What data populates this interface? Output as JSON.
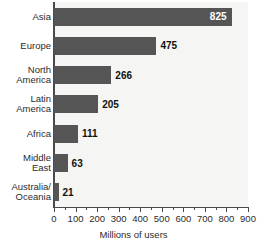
{
  "chart_data": {
    "type": "bar",
    "orientation": "horizontal",
    "title": "",
    "xlabel": "Millions of users",
    "ylabel": "",
    "categories": [
      "Asia",
      "Europe",
      "North America",
      "Latin America",
      "Africa",
      "Middle East",
      "Australia/ Oceania"
    ],
    "category_lines": [
      [
        "Asia"
      ],
      [
        "Europe"
      ],
      [
        "North",
        "America"
      ],
      [
        "Latin",
        "America"
      ],
      [
        "Africa"
      ],
      [
        "Middle",
        "East"
      ],
      [
        "Australia/",
        "Oceania"
      ]
    ],
    "values": [
      825,
      475,
      266,
      205,
      111,
      63,
      21
    ],
    "value_labels": [
      "825",
      "475",
      "266",
      "205",
      "111",
      "63",
      "21"
    ],
    "label_placement": [
      "inside",
      "outside",
      "outside",
      "outside",
      "outside",
      "outside",
      "outside"
    ],
    "xlim": [
      0,
      900
    ],
    "xticks": [
      0,
      100,
      200,
      300,
      400,
      500,
      600,
      700,
      800,
      900
    ],
    "xtick_labels": [
      "0",
      "100",
      "200",
      "300",
      "400",
      "500",
      "600",
      "700",
      "800",
      "900"
    ],
    "minor_tick_step": 50,
    "grid": false,
    "legend": false,
    "colors": {
      "bar": "#555555",
      "plot_background": "#f5f5f3",
      "axis": "#4a4a4a",
      "text": "#2b2b2b",
      "value_label_inside": "#ffffff",
      "value_label_outside": "#111111"
    }
  }
}
